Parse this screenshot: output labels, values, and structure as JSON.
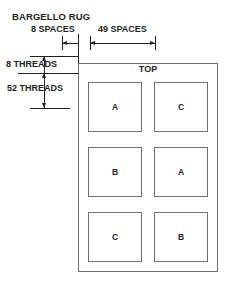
{
  "title": "BARGELLO RUG",
  "dimensions": {
    "top_left": "8 SPACES",
    "top_right": "49 SPACES",
    "left_upper": "8 THREADS",
    "left_lower": "52 THREADS"
  },
  "rug": {
    "top_label": "TOP",
    "blocks": [
      {
        "label": "A"
      },
      {
        "label": "C"
      },
      {
        "label": "B"
      },
      {
        "label": "A"
      },
      {
        "label": "C"
      },
      {
        "label": "B"
      }
    ]
  },
  "colors": {
    "ink": "#231f20",
    "rule": "#6d6e71",
    "background": "#ffffff"
  }
}
